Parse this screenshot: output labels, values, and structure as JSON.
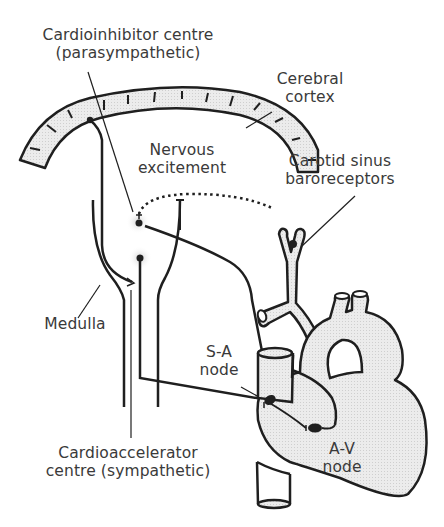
{
  "diagram": {
    "labels": {
      "cardioinhibitor": {
        "line1": "Cardioinhibitor centre",
        "line2": "(parasympathetic)"
      },
      "cerebral_cortex": {
        "line1": "Cerebral",
        "line2": "cortex"
      },
      "nervous_excitement": {
        "line1": "Nervous",
        "line2": "excitement"
      },
      "carotid_sinus": {
        "line1": "Carotid sinus",
        "line2": "baroreceptors"
      },
      "medulla": {
        "line1": "Medulla"
      },
      "sa_node": {
        "line1": "S-A",
        "line2": "node"
      },
      "cardioaccelerator": {
        "line1": "Cardioaccelerator",
        "line2": "centre (sympathetic)"
      },
      "av_node": {
        "line1": "A-V",
        "line2": "node"
      }
    },
    "colors": {
      "stroke": "#1f1f1f",
      "fill_tissue": "#e6e6e6",
      "text": "#3a3a3a",
      "glow": "#d8d8d8"
    }
  }
}
